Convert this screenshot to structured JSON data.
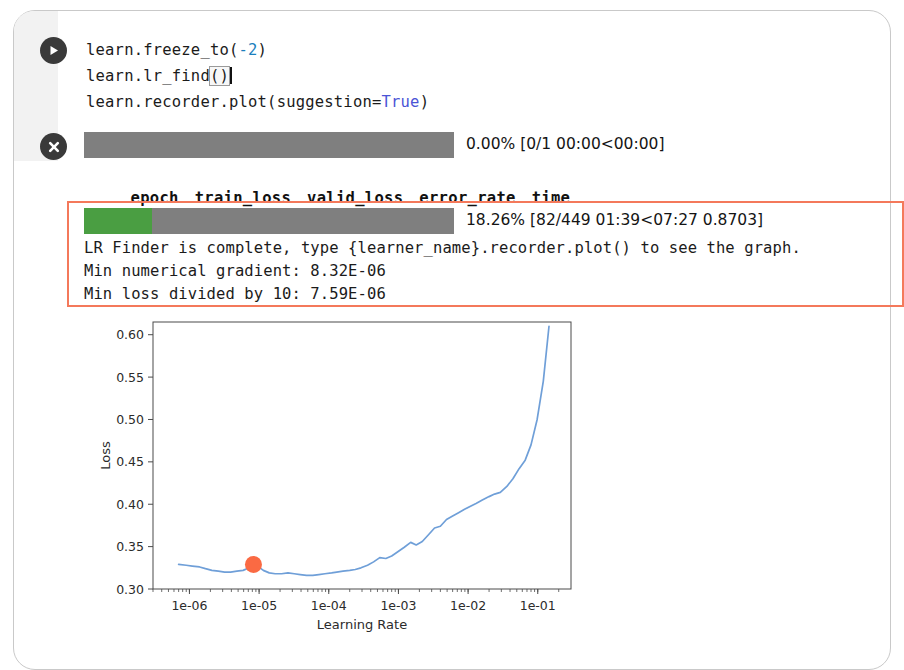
{
  "cell": {
    "run_icon": "play-icon",
    "stop_icon": "close-icon",
    "code_lines": [
      {
        "segments": [
          {
            "t": "learn.freeze_to(",
            "c": "plain"
          },
          {
            "t": "-2",
            "c": "num"
          },
          {
            "t": ")",
            "c": "plain"
          }
        ]
      },
      {
        "segments": [
          {
            "t": "learn.lr_find",
            "c": "plain"
          },
          {
            "t": "()",
            "c": "caret"
          }
        ]
      },
      {
        "segments": [
          {
            "t": "learn.recorder.plot(suggestion=",
            "c": "plain"
          },
          {
            "t": "True",
            "c": "kw"
          },
          {
            "t": ")",
            "c": "plain"
          }
        ]
      }
    ],
    "code_line_1_prefix": "learn.freeze_to(",
    "code_line_1_num": "-2",
    "code_line_1_suffix": ")",
    "code_line_2_prefix": "learn.lr_find",
    "code_line_2_caret": "()",
    "code_line_3_prefix": "learn.recorder.plot(suggestion=",
    "code_line_3_kw": "True",
    "code_line_3_suffix": ")"
  },
  "progress_epoch": {
    "percent_value": 0,
    "label": "0.00% [0/1 00:00<00:00]",
    "track_color": "#7f7f7f",
    "fill_color": "#4a9e42"
  },
  "metrics_table": {
    "columns": [
      "epoch",
      "train_loss",
      "valid_loss",
      "error_rate",
      "time"
    ],
    "rows": []
  },
  "progress_batch": {
    "percent_value": 18.26,
    "label": "18.26% [82/449 01:39<07:27 0.8703]",
    "track_color": "#7f7f7f",
    "fill_color": "#4a9e42"
  },
  "highlight": {
    "border_color": "#f4795b"
  },
  "lr_finder_output": {
    "line_1": "LR Finder is complete, type {learner_name}.recorder.plot() to see the graph.",
    "line_2": "Min numerical gradient: 8.32E-06",
    "line_3": "Min loss divided by 10: 7.59E-06"
  },
  "chart_data": {
    "type": "line",
    "title": "",
    "xlabel": "Learning Rate",
    "ylabel": "Loss",
    "xscale": "log",
    "xlim": [
      3e-07,
      0.3
    ],
    "ylim": [
      0.3,
      0.615
    ],
    "grid": false,
    "legend": null,
    "xticks": [
      1e-06,
      1e-05,
      0.0001,
      0.001,
      0.01,
      0.1
    ],
    "xtick_labels": [
      "1e-06",
      "1e-05",
      "1e-04",
      "1e-03",
      "1e-02",
      "1e-01"
    ],
    "yticks": [
      0.3,
      0.35,
      0.4,
      0.45,
      0.5,
      0.55,
      0.6
    ],
    "ytick_labels": [
      "0.30",
      "0.35",
      "0.40",
      "0.45",
      "0.50",
      "0.55",
      "0.60"
    ],
    "line_color": "#6f9fd8",
    "marker_color": "#fa6a43",
    "suggestion_marker": {
      "x": 8.3e-06,
      "y": 0.329,
      "label": "min numerical gradient"
    },
    "series": [
      {
        "name": "loss",
        "x": [
          7e-07,
          9e-07,
          1.1e-06,
          1.4e-06,
          1.7e-06,
          2.1e-06,
          2.6e-06,
          3.2e-06,
          3.9e-06,
          4.8e-06,
          5.9e-06,
          7.2e-06,
          8.3e-06,
          9.5e-06,
          1.15e-05,
          1.4e-05,
          1.7e-05,
          2.1e-05,
          2.6e-05,
          3.2e-05,
          3.9e-05,
          4.8e-05,
          5.9e-05,
          7.2e-05,
          8.8e-05,
          0.00011,
          0.00013,
          0.00016,
          0.0002,
          0.00024,
          0.00029,
          0.00036,
          0.00044,
          0.00054,
          0.00066,
          0.0008,
          0.00098,
          0.0012,
          0.0015,
          0.0018,
          0.0022,
          0.0027,
          0.0033,
          0.004,
          0.0049,
          0.006,
          0.0073,
          0.0089,
          0.011,
          0.013,
          0.016,
          0.02,
          0.024,
          0.029,
          0.036,
          0.044,
          0.054,
          0.066,
          0.08,
          0.098,
          0.12,
          0.145
        ],
        "y": [
          0.329,
          0.328,
          0.327,
          0.326,
          0.324,
          0.322,
          0.321,
          0.32,
          0.32,
          0.321,
          0.322,
          0.325,
          0.329,
          0.327,
          0.322,
          0.319,
          0.318,
          0.318,
          0.319,
          0.318,
          0.317,
          0.316,
          0.316,
          0.317,
          0.318,
          0.319,
          0.32,
          0.321,
          0.322,
          0.323,
          0.325,
          0.328,
          0.332,
          0.337,
          0.336,
          0.339,
          0.344,
          0.349,
          0.355,
          0.352,
          0.356,
          0.364,
          0.372,
          0.374,
          0.382,
          0.386,
          0.39,
          0.394,
          0.398,
          0.401,
          0.405,
          0.409,
          0.412,
          0.414,
          0.421,
          0.43,
          0.442,
          0.452,
          0.47,
          0.5,
          0.545,
          0.61
        ]
      }
    ]
  }
}
